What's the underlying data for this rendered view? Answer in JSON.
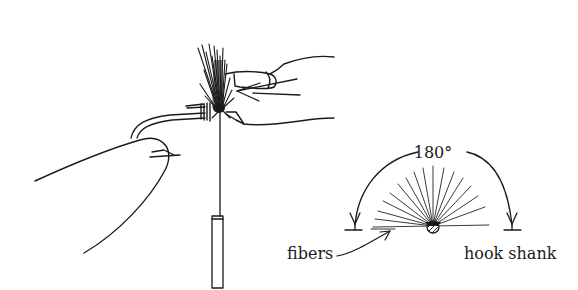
{
  "figure": {
    "type": "line-illustration",
    "colors": {
      "ink": "#1a1a1a",
      "background": "#ffffff"
    }
  },
  "labels": {
    "angle": "180°",
    "fibers": "fibers",
    "hook_shank": "hook shank"
  },
  "inset": {
    "description": "end-view diagram showing fibers spread through 180 degrees around hook shank",
    "angle_degrees": 180,
    "fiber_count": 17
  }
}
